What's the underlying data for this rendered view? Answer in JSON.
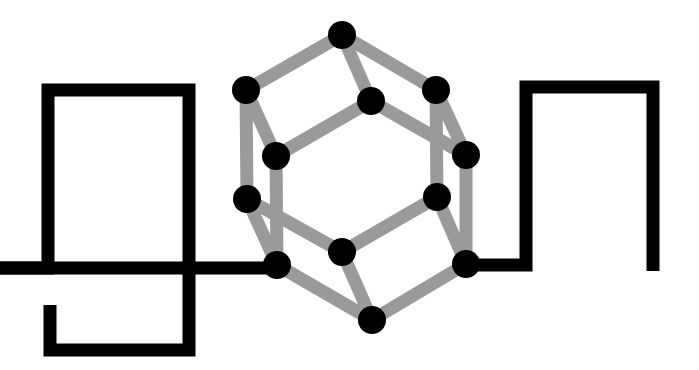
{
  "diagram": {
    "title": "Molecular cage coupled to a wire circuit",
    "canvas": {
      "width": 699,
      "height": 370,
      "background": "#ffffff"
    },
    "colors": {
      "wire": "#000000",
      "bond": "#9a9a9a",
      "atom": "#000000"
    },
    "wire": {
      "stroke_width": 13,
      "left_path": [
        [
          0,
          268
        ],
        [
          48,
          268
        ],
        [
          48,
          90
        ],
        [
          189,
          90
        ],
        [
          189,
          350
        ],
        [
          50,
          350
        ],
        [
          50,
          305
        ]
      ],
      "left_lead": [
        [
          0,
          268
        ],
        [
          277,
          268
        ]
      ],
      "right_lead": [
        [
          466,
          265
        ],
        [
          526,
          265
        ],
        [
          526,
          87
        ],
        [
          653,
          87
        ],
        [
          653,
          271
        ]
      ]
    },
    "cage": {
      "bond_width": 13,
      "atom_radius": 14,
      "atoms": [
        {
          "id": "top",
          "x": 342,
          "y": 35
        },
        {
          "id": "upper-left",
          "x": 246,
          "y": 90
        },
        {
          "id": "inner-top",
          "x": 371,
          "y": 101
        },
        {
          "id": "upper-right",
          "x": 436,
          "y": 90
        },
        {
          "id": "left-mid-inner",
          "x": 276,
          "y": 156
        },
        {
          "id": "right-mid",
          "x": 466,
          "y": 155
        },
        {
          "id": "left-lower",
          "x": 247,
          "y": 199
        },
        {
          "id": "right-lower-inner",
          "x": 437,
          "y": 197
        },
        {
          "id": "lower-left-junction",
          "x": 277,
          "y": 265
        },
        {
          "id": "center-lower",
          "x": 342,
          "y": 252
        },
        {
          "id": "right-lower-junction",
          "x": 466,
          "y": 264
        },
        {
          "id": "bottom",
          "x": 372,
          "y": 320
        }
      ],
      "bonds": [
        [
          "top",
          "upper-left"
        ],
        [
          "top",
          "upper-right"
        ],
        [
          "top",
          "inner-top"
        ],
        [
          "upper-left",
          "left-lower"
        ],
        [
          "upper-left",
          "left-mid-inner"
        ],
        [
          "inner-top",
          "left-mid-inner"
        ],
        [
          "inner-top",
          "right-mid"
        ],
        [
          "upper-right",
          "right-mid"
        ],
        [
          "upper-right",
          "right-lower-inner"
        ],
        [
          "left-mid-inner",
          "lower-left-junction"
        ],
        [
          "right-mid",
          "right-lower-junction"
        ],
        [
          "left-lower",
          "lower-left-junction"
        ],
        [
          "left-lower",
          "center-lower"
        ],
        [
          "right-lower-inner",
          "center-lower"
        ],
        [
          "right-lower-inner",
          "right-lower-junction"
        ],
        [
          "center-lower",
          "bottom"
        ],
        [
          "lower-left-junction",
          "bottom"
        ],
        [
          "right-lower-junction",
          "bottom"
        ]
      ]
    }
  }
}
